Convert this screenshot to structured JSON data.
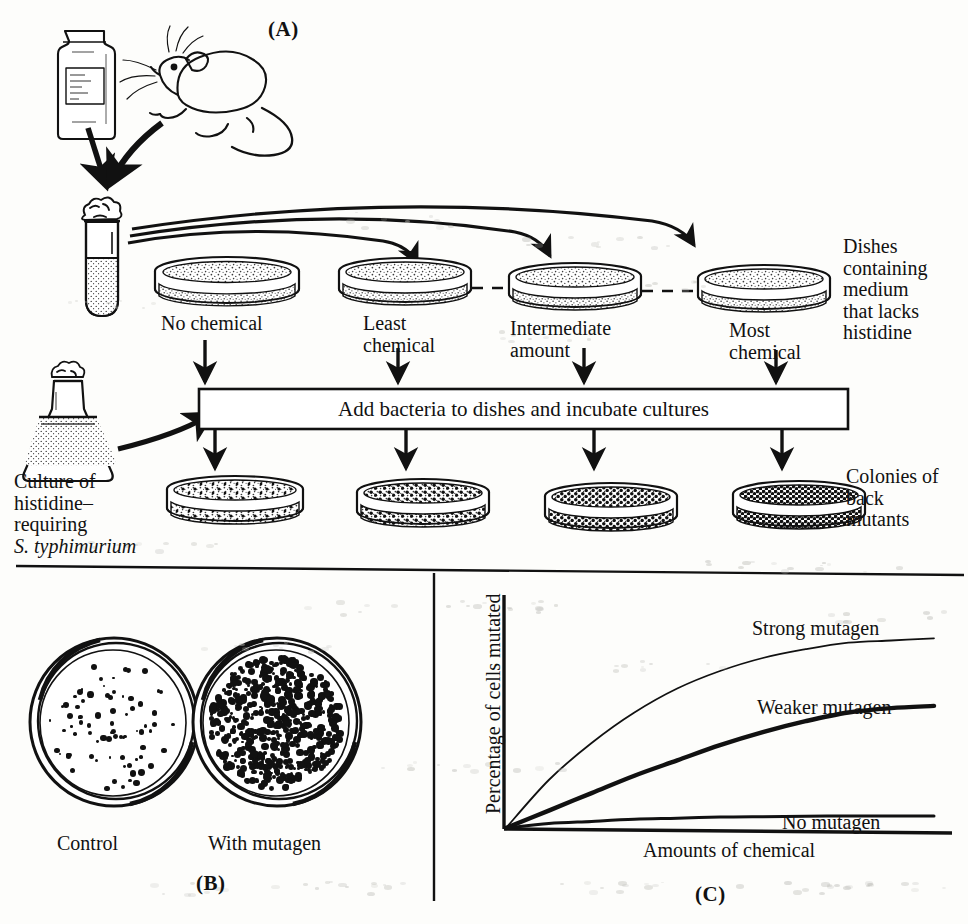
{
  "figure": {
    "title_semantic": "Ames test for mutagenicity",
    "panels": [
      {
        "id": "A",
        "letter": "(A)"
      },
      {
        "id": "B",
        "letter": "(B)"
      },
      {
        "id": "C",
        "letter": "(C)"
      }
    ]
  },
  "panel_a": {
    "letter": "(A)",
    "dish_labels": [
      {
        "line1": "No chemical",
        "line2": ""
      },
      {
        "line1": "Least",
        "line2": "chemical"
      },
      {
        "line1": "Intermediate",
        "line2": "amount"
      },
      {
        "line1": "Most",
        "line2": "chemical"
      }
    ],
    "right_note_top": [
      "Dishes",
      "containing",
      "medium",
      "that lacks",
      "histidine"
    ],
    "right_note_bottom": [
      "Colonies of",
      "back",
      "mutants"
    ],
    "process_box": "Add bacteria to dishes and incubate cultures",
    "culture_label": [
      "Culture of",
      "histidine–",
      "requiring"
    ],
    "culture_species": "S. typhimurium",
    "icons": {
      "chemical_jar": "chemical-bottle-icon",
      "mouse": "mouse-icon",
      "test_tube": "test-tube-icon",
      "flask": "erlenmeyer-flask-icon",
      "petri_dish": "petri-dish-icon"
    }
  },
  "panel_b": {
    "letter": "(B)",
    "plates": [
      {
        "caption": "Control",
        "colony_count_relative": "few"
      },
      {
        "caption": "With mutagen",
        "colony_count_relative": "many"
      }
    ]
  },
  "panel_c": {
    "letter": "(C)"
  },
  "chart_data": {
    "type": "line",
    "title": "",
    "xlabel": "Amounts of chemical",
    "ylabel": "Percentage of cells mutated",
    "grid": false,
    "legend_position": "inline-right-of-curve",
    "xlim": [
      0,
      1
    ],
    "ylim": [
      0,
      1
    ],
    "x": [
      0,
      0.1,
      0.2,
      0.3,
      0.4,
      0.5,
      0.6,
      0.7,
      0.8,
      0.9,
      1.0
    ],
    "series": [
      {
        "name": "Strong mutagen",
        "label": "Strong mutagen",
        "linewidth": "thin",
        "values": [
          0.0,
          0.22,
          0.39,
          0.53,
          0.64,
          0.72,
          0.78,
          0.82,
          0.85,
          0.86,
          0.87
        ]
      },
      {
        "name": "Weaker mutagen",
        "label": "Weaker mutagen",
        "linewidth": "thick",
        "values": [
          0.0,
          0.08,
          0.16,
          0.24,
          0.31,
          0.38,
          0.44,
          0.49,
          0.53,
          0.55,
          0.56
        ]
      },
      {
        "name": "No mutagen",
        "label": "No mutagen",
        "linewidth": "medium",
        "values": [
          0.0,
          0.02,
          0.03,
          0.04,
          0.045,
          0.05,
          0.052,
          0.054,
          0.055,
          0.055,
          0.055
        ]
      }
    ]
  }
}
